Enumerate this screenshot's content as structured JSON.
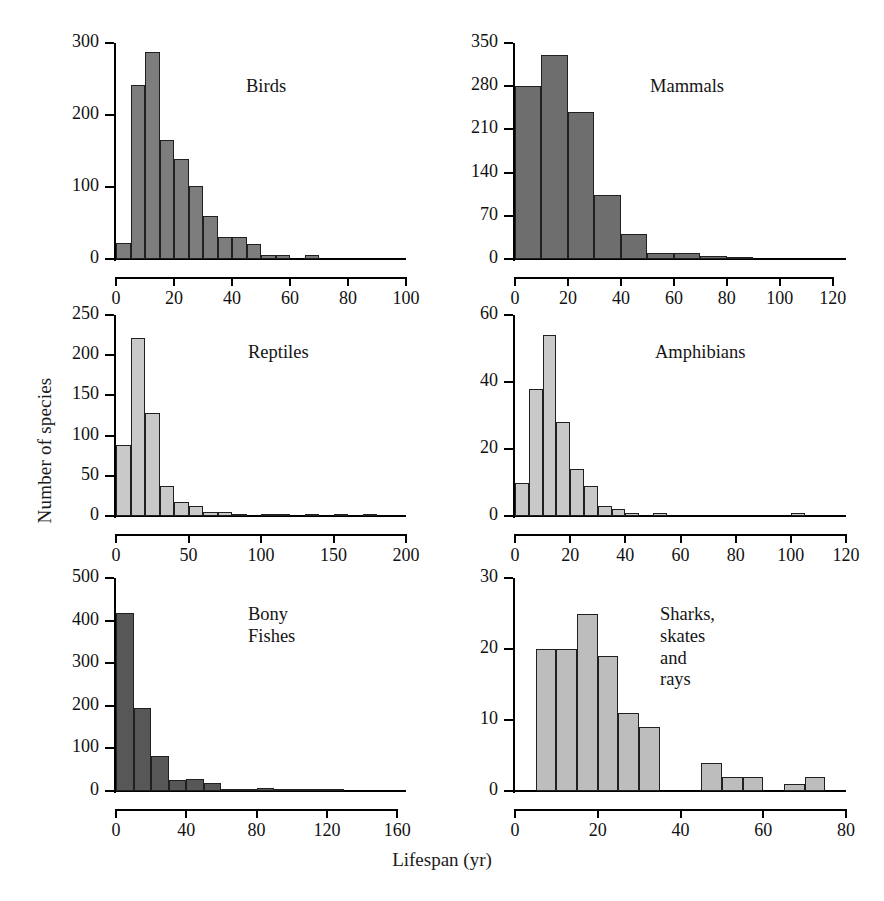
{
  "figure": {
    "xlabel": "Lifespan (yr)",
    "ylabel": "Number of species",
    "background": "#ffffff"
  },
  "chart_data": [
    {
      "type": "bar",
      "title": "Birds",
      "panel": "top-left",
      "xlabel": "Lifespan (yr)",
      "ylabel": "Number of species",
      "xlim": [
        0,
        100
      ],
      "ylim": [
        0,
        300
      ],
      "xticks": [
        0,
        20,
        40,
        60,
        80,
        100
      ],
      "yticks": [
        0,
        100,
        200,
        300
      ],
      "grid": false,
      "bin_width": 5,
      "bar_color": "#7d7d7d",
      "bin_starts": [
        0,
        5,
        10,
        15,
        20,
        25,
        30,
        35,
        40,
        45,
        50,
        55,
        60,
        65,
        70,
        75,
        80
      ],
      "categories": [
        "0-5",
        "5-10",
        "10-15",
        "15-20",
        "20-25",
        "25-30",
        "30-35",
        "35-40",
        "40-45",
        "45-50",
        "50-55",
        "55-60",
        "60-65",
        "65-70",
        "70-75",
        "75-80",
        "80-85"
      ],
      "values": [
        22,
        241,
        288,
        165,
        139,
        102,
        60,
        31,
        31,
        21,
        6,
        6,
        0,
        5,
        0,
        0,
        0
      ]
    },
    {
      "type": "bar",
      "title": "Mammals",
      "panel": "top-right",
      "xlabel": "Lifespan (yr)",
      "ylabel": "Number of species",
      "xlim": [
        0,
        125
      ],
      "ylim": [
        0,
        350
      ],
      "xticks": [
        0,
        20,
        40,
        60,
        80,
        100,
        120
      ],
      "yticks": [
        0,
        70,
        140,
        210,
        280,
        350
      ],
      "grid": false,
      "bin_width": 10,
      "bar_color": "#6e6e6e",
      "bin_starts": [
        0,
        10,
        20,
        30,
        40,
        50,
        60,
        70,
        80,
        90,
        100,
        110
      ],
      "categories": [
        "0-10",
        "10-20",
        "20-30",
        "30-40",
        "40-50",
        "50-60",
        "60-70",
        "70-80",
        "80-90",
        "90-100",
        "100-110",
        "110-120"
      ],
      "values": [
        280,
        330,
        238,
        103,
        40,
        9,
        10,
        5,
        2,
        0,
        0,
        0
      ]
    },
    {
      "type": "bar",
      "title": "Reptiles",
      "panel": "middle-left",
      "xlabel": "Lifespan (yr)",
      "ylabel": "Number of species",
      "xlim": [
        0,
        200
      ],
      "ylim": [
        0,
        250
      ],
      "xticks": [
        0,
        50,
        100,
        150,
        200
      ],
      "yticks": [
        0,
        50,
        100,
        150,
        200,
        250
      ],
      "grid": false,
      "bin_width": 10,
      "bar_color": "#c9c9c9",
      "bin_starts": [
        0,
        10,
        20,
        30,
        40,
        50,
        60,
        70,
        80,
        90,
        100,
        110,
        120,
        130,
        140,
        150,
        160,
        170
      ],
      "categories": [
        "0-10",
        "10-20",
        "20-30",
        "30-40",
        "40-50",
        "50-60",
        "60-70",
        "70-80",
        "80-90",
        "90-100",
        "100-110",
        "110-120",
        "120-130",
        "130-140",
        "140-150",
        "150-160",
        "160-170",
        "170-180"
      ],
      "values": [
        88,
        222,
        128,
        37,
        18,
        13,
        5,
        5,
        1,
        0,
        1,
        1,
        0,
        1,
        0,
        1,
        0,
        1
      ]
    },
    {
      "type": "bar",
      "title": "Amphibians",
      "panel": "middle-right",
      "xlabel": "Lifespan (yr)",
      "ylabel": "Number of species",
      "xlim": [
        0,
        120
      ],
      "ylim": [
        0,
        60
      ],
      "xticks": [
        0,
        20,
        40,
        60,
        80,
        100,
        120
      ],
      "yticks": [
        0,
        20,
        40,
        60
      ],
      "grid": false,
      "bin_width": 5,
      "bar_color": "#c9c9c9",
      "bin_starts": [
        0,
        5,
        10,
        15,
        20,
        25,
        30,
        35,
        40,
        45,
        50,
        100
      ],
      "categories": [
        "0-5",
        "5-10",
        "10-15",
        "15-20",
        "20-25",
        "25-30",
        "30-35",
        "35-40",
        "40-45",
        "45-50",
        "50-55",
        "100-105"
      ],
      "values": [
        10,
        38,
        54,
        28,
        14,
        9,
        3,
        2,
        1,
        0,
        1,
        1
      ]
    },
    {
      "type": "bar",
      "title": "Bony Fishes",
      "panel": "bottom-left",
      "xlabel": "Lifespan (yr)",
      "ylabel": "Number of species",
      "xlim": [
        0,
        165
      ],
      "ylim": [
        0,
        500
      ],
      "xticks": [
        0,
        40,
        80,
        120,
        160
      ],
      "yticks": [
        0,
        100,
        200,
        300,
        400,
        500
      ],
      "grid": false,
      "bin_width": 10,
      "bar_color": "#575757",
      "bin_starts": [
        0,
        10,
        20,
        30,
        40,
        50,
        60,
        70,
        80,
        90,
        100,
        110,
        120
      ],
      "categories": [
        "0-10",
        "10-20",
        "20-30",
        "30-40",
        "40-50",
        "50-60",
        "60-70",
        "70-80",
        "80-90",
        "90-100",
        "100-110",
        "110-120",
        "120-130"
      ],
      "values": [
        418,
        194,
        83,
        25,
        27,
        18,
        3,
        2,
        8,
        3,
        1,
        1,
        1
      ]
    },
    {
      "type": "bar",
      "title": "Sharks,\nskates and rays",
      "panel": "bottom-right",
      "xlabel": "Lifespan (yr)",
      "ylabel": "Number of species",
      "xlim": [
        0,
        80
      ],
      "ylim": [
        0,
        30
      ],
      "xticks": [
        0,
        20,
        40,
        60,
        80
      ],
      "yticks": [
        0,
        10,
        20,
        30
      ],
      "grid": false,
      "bin_width": 5,
      "bar_color": "#bdbdbd",
      "bin_starts": [
        5,
        10,
        15,
        20,
        25,
        30,
        35,
        40,
        45,
        50,
        55,
        60,
        65,
        70
      ],
      "categories": [
        "5-10",
        "10-15",
        "15-20",
        "20-25",
        "25-30",
        "30-35",
        "35-40",
        "40-45",
        "45-50",
        "50-55",
        "55-60",
        "60-65",
        "65-70",
        "70-75"
      ],
      "values": [
        20,
        20,
        25,
        19,
        11,
        9,
        0,
        0,
        4,
        2,
        2,
        0,
        1,
        2
      ]
    }
  ]
}
